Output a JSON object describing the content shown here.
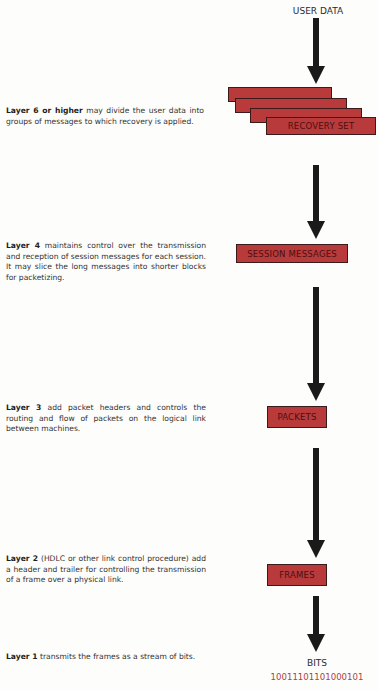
{
  "diagram": {
    "top_label": "USER DATA",
    "stages": [
      {
        "box_label": "RECOVERY SET",
        "layer_bold": "Layer 6 or higher",
        "description": " may divide the user data into groups of messages to which recovery is applied."
      },
      {
        "box_label": "SESSION MESSAGES",
        "layer_bold": "Layer 4",
        "description": " maintains control over the transmission and reception of session messages for each session.  It may slice the long messages into shorter blocks for packetizing."
      },
      {
        "box_label": "PACKETS",
        "layer_bold": "Layer 3",
        "description": " add packet headers and controls the routing and flow of packets on the logical link between machines."
      },
      {
        "box_label": "FRAMES",
        "layer_bold": "Layer 2",
        "description": " (HDLC or other link control procedure) add a header and trailer for controlling the transmission of a frame over a physical link."
      }
    ],
    "final": {
      "layer_bold": "Layer 1",
      "description": " transmits the frames as a stream of bits.",
      "label": "BITS",
      "bitstream": "1001110110100010​1"
    },
    "colors": {
      "box_fill": "#b83a3a",
      "bits_text": "#b04040"
    }
  }
}
